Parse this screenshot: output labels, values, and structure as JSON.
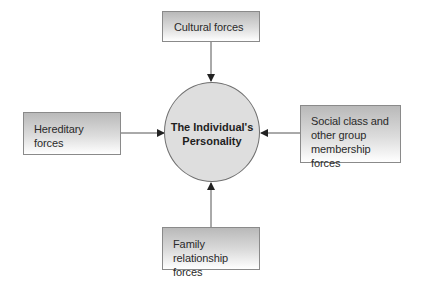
{
  "diagram": {
    "center": {
      "label": "The Individual's\nPersonality"
    },
    "nodes": [
      {
        "id": "cultural",
        "label": "Cultural forces",
        "position": "top"
      },
      {
        "id": "hereditary",
        "label": "Hereditary\nforces",
        "position": "left"
      },
      {
        "id": "social",
        "label": "Social class and\nother group\nmembership forces",
        "position": "right"
      },
      {
        "id": "family",
        "label": "Family relationship\nforces",
        "position": "bottom"
      }
    ],
    "edges": [
      {
        "from": "cultural",
        "to": "center"
      },
      {
        "from": "hereditary",
        "to": "center"
      },
      {
        "from": "social",
        "to": "center"
      },
      {
        "from": "family",
        "to": "center"
      }
    ],
    "colors": {
      "box_border": "#8a8a8a",
      "box_gradient_top": "#b9b9b9",
      "box_gradient_bottom": "#ffffff",
      "circle_fill": "#dedede",
      "circle_border": "#6f6f6f",
      "arrow": "#333333",
      "text": "#2a2a2a"
    }
  }
}
